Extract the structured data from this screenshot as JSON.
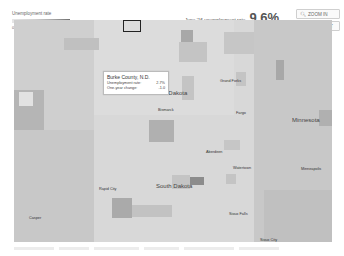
{
  "legend": {
    "title": "Unemployment rate",
    "ticks": [
      "0",
      "5",
      "10",
      "15",
      "20%"
    ]
  },
  "headline": {
    "rate_label": "June '16 unemployment rate",
    "rate_value": "9.6%",
    "change_label": "One-year change",
    "change_value": "-0.1 pct. pts."
  },
  "controls": {
    "zoom_in": "ZOOM IN",
    "zoom_out": "ZOOM OUT"
  },
  "tooltip": {
    "title": "Burke County, N.D.",
    "rows": [
      {
        "label": "Unemployment rate:",
        "value": "2.7%"
      },
      {
        "label": "One-year change:",
        "value": "-1.0"
      }
    ]
  },
  "map": {
    "states": [
      "North Dakota",
      "South Dakota",
      "Minnesota"
    ],
    "cities": [
      "Grand Forks",
      "Bismarck",
      "Fargo",
      "Aberdeen",
      "Watertown",
      "Minneapolis",
      "Rapid City",
      "Sioux Falls",
      "Sioux City",
      "Casper"
    ],
    "colors": {
      "base": "#d8d8d8",
      "light": "#e2e2e2",
      "mid": "#c4c4c4",
      "dark": "#a8a8a8",
      "darker": "#8c8c8c"
    }
  }
}
